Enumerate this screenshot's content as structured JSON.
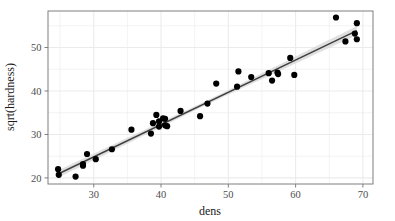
{
  "chart_data": {
    "type": "scatter",
    "title": "",
    "xlabel": "dens",
    "ylabel": "sqrt(hardness)",
    "xlim": [
      23.2,
      71.5
    ],
    "ylim": [
      18.6,
      58.4
    ],
    "xticks": [
      30,
      40,
      50,
      60,
      70
    ],
    "yticks": [
      20,
      30,
      40,
      50
    ],
    "xtick_labels": [
      "30",
      "40",
      "50",
      "60",
      "70"
    ],
    "ytick_labels": [
      "20",
      "30",
      "40",
      "50"
    ],
    "grid": true,
    "grid_minor": true,
    "legend": "none",
    "point_color": "#000000",
    "point_size": 3.1,
    "line_color": "#3f3f3f",
    "ribbon_color": "#d9d9d9",
    "panel_background": "#ffffff",
    "grid_color": "#ebebeb",
    "border_color": "#7f7f7f",
    "points": [
      {
        "x": 24.7,
        "y": 22.0
      },
      {
        "x": 24.8,
        "y": 20.7
      },
      {
        "x": 27.3,
        "y": 20.3
      },
      {
        "x": 28.4,
        "y": 22.8
      },
      {
        "x": 28.4,
        "y": 23.2
      },
      {
        "x": 29.0,
        "y": 25.5
      },
      {
        "x": 30.3,
        "y": 24.3
      },
      {
        "x": 32.7,
        "y": 26.6
      },
      {
        "x": 35.6,
        "y": 31.1
      },
      {
        "x": 38.5,
        "y": 30.2
      },
      {
        "x": 38.8,
        "y": 32.6
      },
      {
        "x": 39.3,
        "y": 34.5
      },
      {
        "x": 39.7,
        "y": 31.8
      },
      {
        "x": 39.7,
        "y": 33.0
      },
      {
        "x": 40.3,
        "y": 33.7
      },
      {
        "x": 40.6,
        "y": 33.6
      },
      {
        "x": 40.6,
        "y": 32.1
      },
      {
        "x": 40.9,
        "y": 31.9
      },
      {
        "x": 42.9,
        "y": 35.4
      },
      {
        "x": 45.8,
        "y": 34.2
      },
      {
        "x": 46.9,
        "y": 37.1
      },
      {
        "x": 48.2,
        "y": 41.7
      },
      {
        "x": 51.3,
        "y": 41.0
      },
      {
        "x": 51.5,
        "y": 44.5
      },
      {
        "x": 53.4,
        "y": 43.2
      },
      {
        "x": 56.0,
        "y": 44.1
      },
      {
        "x": 56.5,
        "y": 42.4
      },
      {
        "x": 57.3,
        "y": 44.2
      },
      {
        "x": 57.4,
        "y": 43.9
      },
      {
        "x": 59.2,
        "y": 47.6
      },
      {
        "x": 59.8,
        "y": 43.7
      },
      {
        "x": 66.0,
        "y": 56.9
      },
      {
        "x": 67.4,
        "y": 51.4
      },
      {
        "x": 68.8,
        "y": 53.2
      },
      {
        "x": 69.1,
        "y": 55.6
      },
      {
        "x": 69.1,
        "y": 51.9
      }
    ],
    "fit_line": {
      "label": "linear regression",
      "x_start": 24.7,
      "y_start": 20.9,
      "x_end": 69.1,
      "y_end": 53.9,
      "ribbon_halfwidth_start": 0.85,
      "ribbon_halfwidth_mid": 0.45,
      "ribbon_halfwidth_end": 1.05
    }
  }
}
